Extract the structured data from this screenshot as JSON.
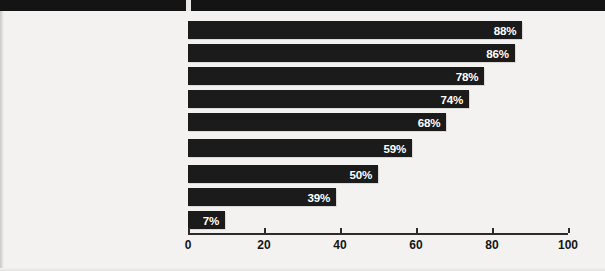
{
  "chart_data": {
    "type": "bar",
    "orientation": "horizontal",
    "title": "",
    "xlabel": "",
    "ylabel": "",
    "xlim": [
      0,
      100
    ],
    "xticks": [
      0,
      20,
      40,
      60,
      80,
      100
    ],
    "xtick_labels": [
      "0",
      "20",
      "40",
      "60",
      "80",
      "100"
    ],
    "grid": false,
    "legend": null,
    "value_suffix": "%",
    "categories": [
      "Criminal records check",
      "Employment verification",
      "Drug screening",
      "Education verification",
      "Reference check",
      "Verification of professional licenses/certifications",
      "Motor vehicle record check",
      "Credit history",
      "Integrity evaluation"
    ],
    "values": [
      88,
      86,
      78,
      74,
      68,
      59,
      50,
      39,
      7
    ],
    "data_labels": [
      "88%",
      "86%",
      "78%",
      "74%",
      "68%",
      "59%",
      "50%",
      "39%",
      "7%"
    ]
  },
  "rows": [
    {
      "label": "Criminal records check",
      "value": 88,
      "value_label": "88%",
      "top": 10,
      "min_width_px": 0
    },
    {
      "label": "Employment verification",
      "value": 86,
      "value_label": "86%",
      "top": 33,
      "min_width_px": 0
    },
    {
      "label": "Drug screening",
      "value": 78,
      "value_label": "78%",
      "top": 56,
      "min_width_px": 0
    },
    {
      "label": "Education verification",
      "value": 74,
      "value_label": "74%",
      "top": 79,
      "min_width_px": 0
    },
    {
      "label": "Reference check",
      "value": 68,
      "value_label": "68%",
      "top": 102,
      "min_width_px": 0
    },
    {
      "label": "Verification of professional\nlicenses/certifications",
      "value": 59,
      "value_label": "59%",
      "top": 128,
      "min_width_px": 0
    },
    {
      "label": "Motor vehicle record check",
      "value": 50,
      "value_label": "50%",
      "top": 154,
      "min_width_px": 0
    },
    {
      "label": "Credit history",
      "value": 39,
      "value_label": "39%",
      "top": 177,
      "min_width_px": 0
    },
    {
      "label": "Integrity evaluation",
      "value": 7,
      "value_label": "7%",
      "top": 200,
      "min_width_px": 37
    }
  ],
  "axis": {
    "ticks": [
      {
        "label": "0",
        "value": 0
      },
      {
        "label": "20",
        "value": 20
      },
      {
        "label": "40",
        "value": 40
      },
      {
        "label": "60",
        "value": 60
      },
      {
        "label": "80",
        "value": 80
      },
      {
        "label": "100",
        "value": 100
      }
    ]
  },
  "colors": {
    "bar": "#1b1b1b",
    "background": "#f3f2f0",
    "header_band": "#141414",
    "text": "#151515",
    "value_text": "#ffffff",
    "axis": "#2b2b2b"
  }
}
